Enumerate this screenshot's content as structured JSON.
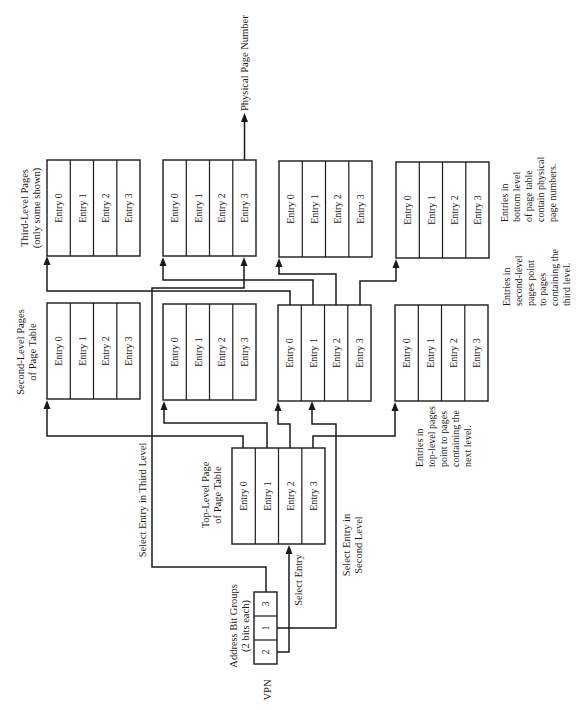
{
  "diagram": {
    "title_labels": {
      "third_level": [
        "Third-Level Pages",
        "(only some shown)"
      ],
      "second_level": [
        "Second-Level Pages",
        "of Page Table"
      ],
      "top_level": [
        "Top-Level Page",
        "of Page Table"
      ],
      "address_groups": [
        "Address Bit Groups",
        "(2 bits each)"
      ],
      "vpn": "VPN",
      "physical_page_number": "Physical Page Number",
      "select_entry": "Select Entry",
      "select_entry_second_level": [
        "Select Entry in",
        "Second Level"
      ],
      "select_entry_third_level": "Select Entry in Third Level"
    },
    "notes": {
      "bottom_level": [
        "Entries in",
        "bottom level",
        "of page table",
        "contain physical",
        "page numbers."
      ],
      "second_level": [
        "Entries in",
        "second-level",
        "pages point",
        "to pages",
        "containing the",
        "third level."
      ],
      "top_level": [
        "Entries in",
        "top-level pages",
        "point to pages",
        "containing the",
        "next level."
      ]
    },
    "entries": [
      "Entry 0",
      "Entry 1",
      "Entry 2",
      "Entry 3"
    ],
    "vpn_groups": [
      "3",
      "1",
      "2"
    ],
    "third_level_pages": [
      {
        "id": "t0",
        "entries": [
          "Entry 0",
          "Entry 1",
          "Entry 2",
          "Entry 3"
        ]
      },
      {
        "id": "t1",
        "entries": [
          "Entry 0",
          "Entry 1",
          "Entry 2",
          "Entry 3"
        ]
      },
      {
        "id": "t2",
        "entries": [
          "Entry 0",
          "Entry 1",
          "Entry 2",
          "Entry 3"
        ]
      },
      {
        "id": "t3",
        "entries": [
          "Entry 0",
          "Entry 1",
          "Entry 2",
          "Entry 3"
        ]
      }
    ],
    "second_level_pages": [
      {
        "id": "s0",
        "entries": [
          "Entry 0",
          "Entry 1",
          "Entry 2",
          "Entry 3"
        ]
      },
      {
        "id": "s1",
        "entries": [
          "Entry 0",
          "Entry 1",
          "Entry 2",
          "Entry 3"
        ]
      },
      {
        "id": "s2",
        "entries": [
          "Entry 0",
          "Entry 1",
          "Entry 2",
          "Entry 3"
        ]
      },
      {
        "id": "s3",
        "entries": [
          "Entry 0",
          "Entry 1",
          "Entry 2",
          "Entry 3"
        ]
      }
    ],
    "top_level_page": {
      "entries": [
        "Entry 0",
        "Entry 1",
        "Entry 2",
        "Entry 3"
      ]
    }
  }
}
